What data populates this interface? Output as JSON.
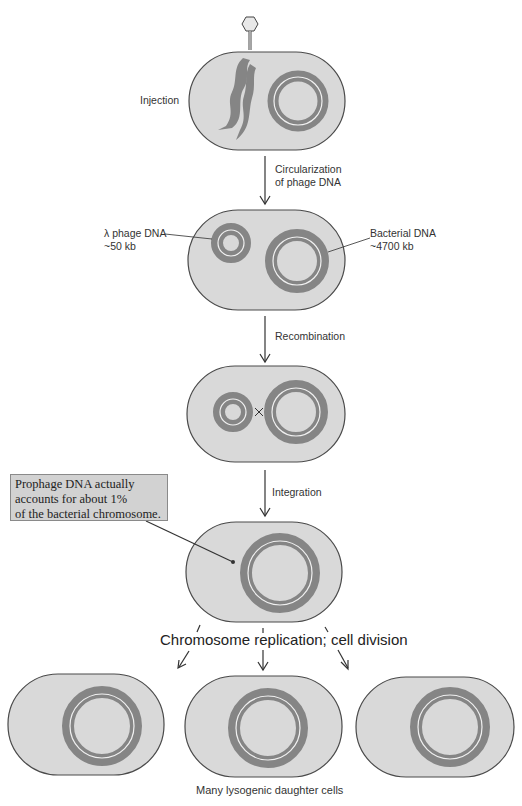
{
  "steps": {
    "injection": "Injection",
    "circularization": [
      "Circularization",
      "of phage DNA"
    ],
    "recombination": "Recombination",
    "integration": "Integration",
    "replication": "Chromosome replication; cell division",
    "result": "Many lysogenic daughter cells"
  },
  "labels": {
    "phage_dna": [
      "λ phage DNA",
      "~50 kb"
    ],
    "bacterial_dna": [
      "Bacterial DNA",
      "~4700 kb"
    ]
  },
  "callout": {
    "lines": [
      "Prophage DNA actually",
      "accounts for about 1%",
      "of the bacterial chromosome."
    ]
  },
  "colors": {
    "cell_fill": "#d9d9d9",
    "dna": "#858585",
    "callout_bg": "#d2d2d2"
  }
}
